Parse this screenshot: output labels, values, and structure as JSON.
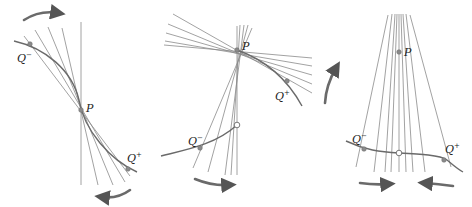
{
  "figure": {
    "panels": [
      {
        "id": "panel-1",
        "labels": {
          "P": "P",
          "Q_minus": "Q",
          "Q_minus_sup": "−",
          "Q_plus": "Q",
          "Q_plus_sup": "+"
        },
        "caption": "Vertical tangent: secants from Q⁻ and Q⁺ approach a vertical line at P"
      },
      {
        "id": "panel-2",
        "labels": {
          "P": "P",
          "Q_minus": "Q",
          "Q_minus_sup": "−",
          "Q_plus": "Q",
          "Q_plus_sup": "+"
        },
        "caption": "Jump discontinuity: left secants approach vertical, right secants approach a horizontal-ish line"
      },
      {
        "id": "panel-3",
        "labels": {
          "P": "P",
          "Q_minus": "Q",
          "Q_minus_sup": "−",
          "Q_plus": "Q",
          "Q_plus_sup": "+"
        },
        "caption": "Removable point: secants from both sides approach vertical through P"
      }
    ],
    "colors": {
      "line": "#8a8a8a",
      "curve": "#6a6a6a",
      "text": "#222222",
      "background": "#ffffff"
    }
  }
}
